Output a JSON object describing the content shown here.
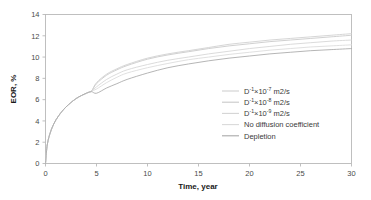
{
  "chart_data": {
    "type": "line",
    "title": "",
    "xlabel": "Time, year",
    "ylabel": "EOR, %",
    "xlim": [
      0,
      30
    ],
    "ylim": [
      0,
      14
    ],
    "xticks": [
      0,
      5,
      10,
      15,
      20,
      25,
      30
    ],
    "yticks": [
      0,
      2,
      4,
      6,
      8,
      10,
      12,
      14
    ],
    "grid": false,
    "legend_position": "center-right",
    "x": [
      0,
      0.15,
      0.4,
      0.8,
      1.3,
      2,
      3,
      4,
      4.5,
      5,
      6,
      7,
      8,
      10,
      12,
      14,
      16,
      18,
      20,
      22,
      24,
      26,
      28,
      30
    ],
    "series": [
      {
        "name": "D-1x10-7 m2/s",
        "label_base": "D",
        "label_sup1": "-1",
        "label_mid": "×10",
        "label_sup2": "-7",
        "label_tail": " m2/s",
        "color": "#cfcfcf",
        "values": [
          0,
          1.6,
          2.7,
          3.7,
          4.5,
          5.3,
          6.1,
          6.6,
          6.8,
          7.6,
          8.4,
          8.9,
          9.3,
          9.9,
          10.3,
          10.6,
          10.9,
          11.2,
          11.4,
          11.6,
          11.75,
          11.9,
          12.05,
          12.2
        ]
      },
      {
        "name": "D-1x10-8 m2/s",
        "label_base": "D",
        "label_sup1": "-1",
        "label_mid": "×10",
        "label_sup2": "-8",
        "label_tail": " m2/s",
        "color": "#c8c8c8",
        "values": [
          0,
          1.6,
          2.7,
          3.7,
          4.5,
          5.3,
          6.1,
          6.6,
          6.8,
          7.5,
          8.3,
          8.8,
          9.2,
          9.8,
          10.2,
          10.5,
          10.8,
          11.05,
          11.25,
          11.45,
          11.6,
          11.75,
          11.9,
          12.05
        ]
      },
      {
        "name": "D-1x10-9 m2/s",
        "label_base": "D",
        "label_sup1": "-1",
        "label_mid": "×10",
        "label_sup2": "-9",
        "label_tail": " m2/s",
        "color": "#d4d4d4",
        "values": [
          0,
          1.6,
          2.7,
          3.7,
          4.5,
          5.3,
          6.1,
          6.6,
          6.8,
          7.2,
          7.9,
          8.4,
          8.8,
          9.3,
          9.7,
          10.0,
          10.3,
          10.55,
          10.8,
          11.0,
          11.2,
          11.35,
          11.5,
          11.6
        ]
      },
      {
        "name": "No diffusion coefficient",
        "label_base": "No diffusion coefficient",
        "label_sup1": "",
        "label_mid": "",
        "label_sup2": "",
        "label_tail": "",
        "color": "#dadada",
        "values": [
          0,
          1.6,
          2.7,
          3.7,
          4.5,
          5.3,
          6.1,
          6.6,
          6.8,
          7.0,
          7.6,
          8.1,
          8.5,
          9.0,
          9.4,
          9.75,
          10.0,
          10.25,
          10.45,
          10.65,
          10.8,
          10.95,
          11.05,
          11.15
        ]
      },
      {
        "name": "Depletion",
        "label_base": "Depletion",
        "label_sup1": "",
        "label_mid": "",
        "label_sup2": "",
        "label_tail": "",
        "color": "#a8a8a8",
        "values": [
          0,
          1.6,
          2.7,
          3.7,
          4.5,
          5.3,
          6.1,
          6.6,
          6.75,
          6.6,
          7.1,
          7.5,
          7.9,
          8.5,
          9.0,
          9.35,
          9.65,
          9.9,
          10.1,
          10.3,
          10.45,
          10.6,
          10.7,
          10.8
        ]
      }
    ]
  },
  "axes": {
    "y_title": "EOR, %",
    "x_title": "Time, year",
    "x_tick_labels": [
      "0",
      "5",
      "10",
      "15",
      "20",
      "25",
      "30"
    ],
    "y_tick_labels": [
      "0",
      "2",
      "4",
      "6",
      "8",
      "10",
      "12",
      "14"
    ]
  },
  "colors": {
    "frame": "#b9b9b9",
    "tick_text": "#4a4a4a",
    "axis_title": "#1a1a1a",
    "background": "#ffffff"
  }
}
